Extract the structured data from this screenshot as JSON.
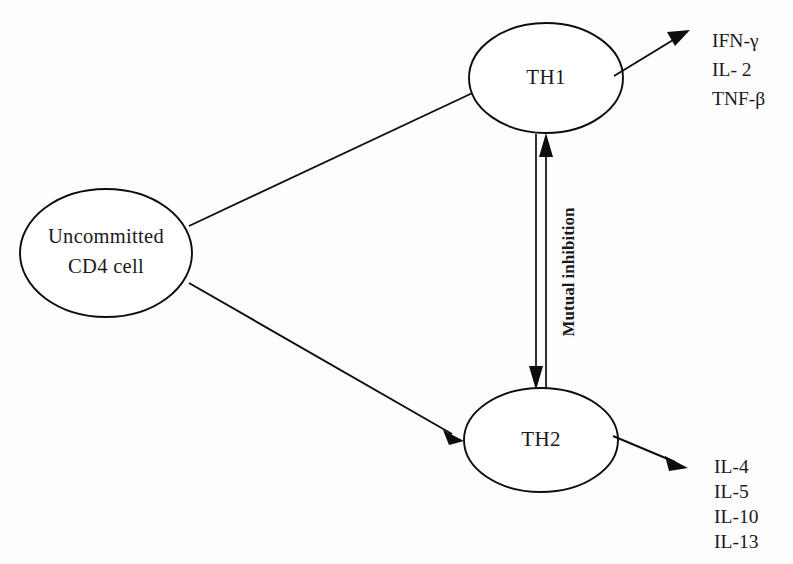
{
  "diagram": {
    "background_color": "#fdfdfd",
    "line_color": "#0d0d0d",
    "text_color": "#1a1a1a",
    "nodes": [
      {
        "id": "uncommitted-cd4",
        "label_line1": "Uncommitted",
        "label_line2": "CD4 cell",
        "shape": "ellipse"
      },
      {
        "id": "th1",
        "label": "TH1",
        "shape": "ellipse"
      },
      {
        "id": "th2",
        "label": "TH2",
        "shape": "ellipse"
      }
    ],
    "edges": [
      {
        "id": "cd4-to-th1",
        "from": "uncommitted-cd4",
        "to": "th1",
        "style": "single-arrow",
        "label": ""
      },
      {
        "id": "cd4-to-th2",
        "from": "uncommitted-cd4",
        "to": "th2",
        "style": "single-arrow",
        "label": ""
      },
      {
        "id": "mutual-inhibition",
        "from": "th1",
        "to": "th2",
        "style": "double-line-bidirectional",
        "label": "Mutual inhibition"
      },
      {
        "id": "th1-secretion",
        "from": "th1",
        "to": "th1-cytokines",
        "style": "single-arrow",
        "label": ""
      },
      {
        "id": "th2-secretion",
        "from": "th2",
        "to": "th2-cytokines",
        "style": "single-arrow",
        "label": ""
      }
    ],
    "th1_cytokines": [
      "IFN-γ",
      "IL- 2",
      "TNF-β"
    ],
    "th2_cytokines": [
      "IL-4",
      "IL-5",
      "IL-10",
      "IL-13"
    ]
  }
}
